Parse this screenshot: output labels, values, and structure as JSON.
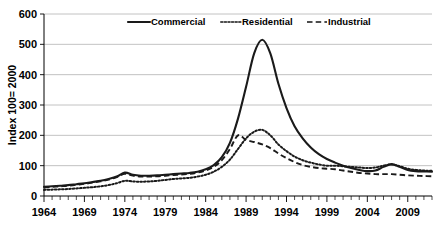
{
  "chart_data": {
    "type": "line",
    "title": "",
    "xlabel": "",
    "ylabel": "Index 100= 2000",
    "xlim": [
      1964,
      2012
    ],
    "ylim": [
      0,
      600
    ],
    "ytick_values": [
      0,
      100,
      200,
      300,
      400,
      500,
      600
    ],
    "ytick_labels": [
      "0",
      "100",
      "200",
      "300",
      "400",
      "500",
      "600"
    ],
    "xtick_values": [
      1964,
      1969,
      1974,
      1979,
      1984,
      1989,
      1994,
      1999,
      2004,
      2009
    ],
    "xtick_labels": [
      "1964",
      "1969",
      "1974",
      "1979",
      "1984",
      "1989",
      "1994",
      "1999",
      "2004",
      "2009"
    ],
    "minor_xticks_every": 1,
    "grid": "horizontal",
    "legend_position": "top-center",
    "x": [
      1964,
      1965,
      1966,
      1967,
      1968,
      1969,
      1970,
      1971,
      1972,
      1973,
      1974,
      1975,
      1976,
      1977,
      1978,
      1979,
      1980,
      1981,
      1982,
      1983,
      1984,
      1985,
      1986,
      1987,
      1988,
      1989,
      1990,
      1991,
      1992,
      1993,
      1994,
      1995,
      1996,
      1997,
      1998,
      1999,
      2000,
      2001,
      2002,
      2003,
      2004,
      2005,
      2006,
      2007,
      2008,
      2009,
      2010,
      2011,
      2012
    ],
    "series": [
      {
        "name": "Commercial",
        "style": "solid",
        "color": "#1a1a1a",
        "values": [
          30,
          32,
          34,
          36,
          39,
          42,
          46,
          50,
          56,
          64,
          77,
          70,
          67,
          67,
          68,
          70,
          72,
          74,
          76,
          80,
          88,
          102,
          128,
          175,
          255,
          360,
          470,
          515,
          470,
          370,
          290,
          230,
          190,
          160,
          138,
          122,
          110,
          100,
          92,
          86,
          82,
          84,
          96,
          105,
          96,
          86,
          82,
          81,
          80
        ]
      },
      {
        "name": "Residential",
        "style": "dotted",
        "color": "#4d4d4d",
        "values": [
          20,
          21,
          22,
          23,
          25,
          27,
          29,
          32,
          36,
          42,
          50,
          48,
          47,
          48,
          50,
          53,
          56,
          58,
          60,
          64,
          70,
          80,
          96,
          120,
          155,
          190,
          212,
          218,
          200,
          170,
          148,
          130,
          118,
          110,
          104,
          100,
          100,
          98,
          96,
          94,
          92,
          94,
          100,
          104,
          98,
          90,
          86,
          84,
          83
        ]
      },
      {
        "name": "Industrial",
        "style": "dashed",
        "color": "#4d4d4d",
        "values": [
          28,
          30,
          32,
          34,
          37,
          40,
          44,
          48,
          54,
          62,
          73,
          67,
          64,
          64,
          65,
          67,
          69,
          71,
          73,
          77,
          84,
          96,
          118,
          155,
          200,
          185,
          178,
          170,
          158,
          140,
          125,
          112,
          102,
          96,
          92,
          90,
          88,
          84,
          80,
          76,
          74,
          72,
          72,
          72,
          70,
          68,
          67,
          66,
          65
        ]
      }
    ],
    "legend": [
      {
        "label": "Commercial",
        "style": "solid"
      },
      {
        "label": "Residential",
        "style": "dotted"
      },
      {
        "label": "Industrial",
        "style": "dashed"
      }
    ]
  }
}
